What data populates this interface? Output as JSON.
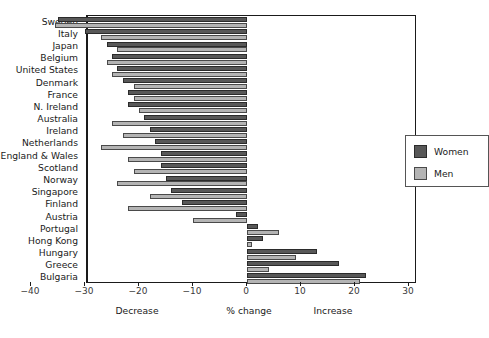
{
  "chart_data": {
    "type": "bar",
    "orientation": "horizontal",
    "title": "",
    "xlabel": "% change",
    "ylabel": "",
    "xlim": [
      -41,
      30
    ],
    "xticks": [
      -40,
      -30,
      -20,
      -10,
      0,
      10,
      20,
      30
    ],
    "xtick_labels": [
      "−40",
      "−30",
      "−20",
      "−10",
      "0",
      "10",
      "20",
      "30"
    ],
    "grid": false,
    "legend_position": "center-right",
    "legend": [
      "Women",
      "Men"
    ],
    "annotations": [
      "Decrease",
      "% change",
      "Increase"
    ],
    "categories": [
      "Sweden",
      "Italy",
      "Japan",
      "Belgium",
      "United States",
      "Denmark",
      "France",
      "N. Ireland",
      "Australia",
      "Ireland",
      "Netherlands",
      "England & Wales",
      "Scotland",
      "Norway",
      "Singapore",
      "Finland",
      "Austria",
      "Portugal",
      "Hong Kong",
      "Hungary",
      "Greece",
      "Bulgaria"
    ],
    "series": [
      {
        "name": "Women",
        "color": "#585858",
        "values": [
          -35,
          -30,
          -26,
          -25,
          -24,
          -23,
          -22,
          -22,
          -19,
          -18,
          -17,
          -16,
          -16,
          -15,
          -14,
          -12,
          -2,
          2,
          3,
          13,
          17,
          22
        ]
      },
      {
        "name": "Men",
        "color": "#b4b4b4",
        "values": [
          -35.5,
          -27,
          -24,
          -26,
          -25,
          -21,
          -21,
          -20,
          -25,
          -23,
          -27,
          -22,
          -21,
          -24,
          -18,
          -22,
          -10,
          6,
          1,
          9,
          4,
          21
        ]
      }
    ]
  },
  "legend": {
    "women_label": "Women",
    "men_label": "Men"
  },
  "axis": {
    "decrease_label": "Decrease",
    "change_label": "% change",
    "increase_label": "Increase"
  }
}
